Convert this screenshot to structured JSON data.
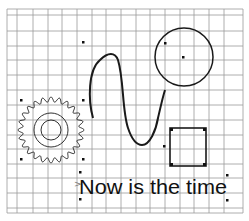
{
  "canvas": {
    "title": "Drawing canvas with shapes",
    "grid": {
      "visible": true,
      "color": "#9a9a9a"
    }
  },
  "shapes": {
    "gear": {
      "label": "gear",
      "teeth": 24,
      "stroke": "#333333"
    },
    "circle": {
      "label": "circle",
      "stroke": "#1a1a1a"
    },
    "curve": {
      "label": "wave curve",
      "stroke": "#1a1a1a"
    },
    "square": {
      "label": "square",
      "stroke": "#1a1a1a"
    },
    "text": {
      "label": "text box",
      "value": "Now is the time",
      "cursor_marker": ">"
    }
  }
}
